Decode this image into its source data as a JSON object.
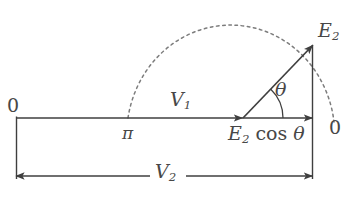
{
  "figure": {
    "type": "phasor-vector-diagram",
    "background_color": "#ffffff",
    "stroke_color": "#3f3f3f",
    "label_color": "#474747",
    "labels": {
      "origin_left": "0",
      "origin_right": "0",
      "v1": "V",
      "v1_sub": "1",
      "v2": "V",
      "v2_sub": "2",
      "pi": "π",
      "e2": "E",
      "e2_sub": "2",
      "theta": "θ",
      "e2_cos_theta_sym": "E",
      "e2_cos_theta_sub": "2",
      "e2_cos_theta_fn": "cos",
      "e2_cos_theta_arg": "θ"
    },
    "geometry": {
      "baseline_y": 118,
      "baseline_x_start": 16,
      "baseline_x_end": 313,
      "v1_arrow_tip_x": 243,
      "vector_origin": [
        243,
        118
      ],
      "e2_tip": [
        313,
        45
      ],
      "arc_left_end": [
        128,
        118
      ],
      "arc_apex": [
        225,
        8
      ],
      "arc_right_end": [
        334,
        122
      ],
      "dimension_line_y": 176,
      "theta_arc_radius": 40,
      "theta_degrees": 46
    }
  }
}
